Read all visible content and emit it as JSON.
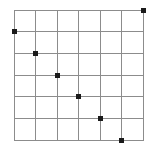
{
  "chart_data": {
    "type": "scatter",
    "title": "",
    "subtitle": "",
    "xlabel": "",
    "ylabel": "",
    "xlim": [
      0,
      6
    ],
    "ylim": [
      0,
      6
    ],
    "grid": true,
    "grid_cols": 6,
    "grid_rows": 6,
    "legend": null,
    "legend_position": "none",
    "xticks": [
      0,
      1,
      2,
      3,
      4,
      5,
      6
    ],
    "yticks": [
      0,
      1,
      2,
      3,
      4,
      5,
      6
    ],
    "xticklabels": [
      "",
      "",
      "",
      "",
      "",
      "",
      ""
    ],
    "yticklabels": [
      "",
      "",
      "",
      "",
      "",
      "",
      ""
    ],
    "marker": "square",
    "marker_size": 5,
    "point_color": "#1a1a1a",
    "grid_color": "#8c8c8c",
    "border_color": "#8c8c8c",
    "background_color": "#ffffff",
    "series": [
      {
        "name": "points",
        "points": [
          {
            "x": 6,
            "y": 6,
            "col": 6,
            "row": 0
          },
          {
            "x": 0,
            "y": 5,
            "col": 0,
            "row": 1
          },
          {
            "x": 1,
            "y": 4,
            "col": 1,
            "row": 2
          },
          {
            "x": 2,
            "y": 3,
            "col": 2,
            "row": 3
          },
          {
            "x": 3,
            "y": 2,
            "col": 3,
            "row": 4
          },
          {
            "x": 4,
            "y": 1,
            "col": 4,
            "row": 5
          },
          {
            "x": 5,
            "y": 0,
            "col": 5,
            "row": 6
          }
        ]
      }
    ],
    "annotations": []
  },
  "figure": {
    "plot_left": 14,
    "plot_top": 10,
    "plot_right": 143,
    "plot_bottom": 140,
    "cell_width": 21.5,
    "cell_height": 21.667
  }
}
